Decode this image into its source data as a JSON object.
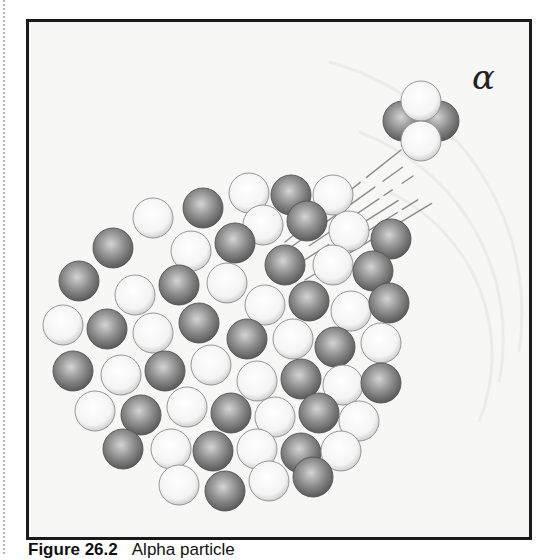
{
  "figure": {
    "symbol": "α",
    "caption_number": "Figure 26.2",
    "caption_text": "Alpha particle",
    "colors": {
      "frame": "#1a1a1a",
      "background": "#f7f7f6",
      "proton_dark": "#6e6e6e",
      "proton_light": "#d4d4d4",
      "neutron_dark": "#c9c9c9",
      "neutron_light": "#ffffff",
      "trail": "#8a8a8a"
    },
    "nucleus": {
      "radius": 20,
      "particles": [
        [
          246,
          190,
          "n"
        ],
        [
          288,
          192,
          "p"
        ],
        [
          330,
          192,
          "n"
        ],
        [
          200,
          205,
          "p"
        ],
        [
          260,
          222,
          "n"
        ],
        [
          304,
          218,
          "p"
        ],
        [
          346,
          228,
          "n"
        ],
        [
          388,
          236,
          "p"
        ],
        [
          150,
          215,
          "n"
        ],
        [
          110,
          245,
          "p"
        ],
        [
          188,
          248,
          "n"
        ],
        [
          232,
          240,
          "p"
        ],
        [
          282,
          262,
          "p"
        ],
        [
          330,
          262,
          "n"
        ],
        [
          370,
          268,
          "p"
        ],
        [
          76,
          278,
          "p"
        ],
        [
          132,
          292,
          "n"
        ],
        [
          176,
          282,
          "p"
        ],
        [
          224,
          280,
          "n"
        ],
        [
          262,
          302,
          "n"
        ],
        [
          306,
          298,
          "p"
        ],
        [
          348,
          308,
          "n"
        ],
        [
          386,
          300,
          "p"
        ],
        [
          60,
          322,
          "n"
        ],
        [
          104,
          326,
          "p"
        ],
        [
          150,
          330,
          "n"
        ],
        [
          196,
          320,
          "p"
        ],
        [
          244,
          336,
          "p"
        ],
        [
          290,
          336,
          "n"
        ],
        [
          332,
          344,
          "p"
        ],
        [
          378,
          340,
          "n"
        ],
        [
          70,
          368,
          "p"
        ],
        [
          118,
          372,
          "n"
        ],
        [
          162,
          368,
          "p"
        ],
        [
          208,
          362,
          "n"
        ],
        [
          254,
          378,
          "n"
        ],
        [
          298,
          376,
          "p"
        ],
        [
          340,
          382,
          "n"
        ],
        [
          378,
          380,
          "p"
        ],
        [
          92,
          408,
          "n"
        ],
        [
          138,
          412,
          "p"
        ],
        [
          184,
          404,
          "n"
        ],
        [
          228,
          410,
          "p"
        ],
        [
          272,
          414,
          "n"
        ],
        [
          316,
          410,
          "p"
        ],
        [
          356,
          418,
          "n"
        ],
        [
          120,
          446,
          "p"
        ],
        [
          168,
          446,
          "n"
        ],
        [
          210,
          448,
          "p"
        ],
        [
          254,
          446,
          "n"
        ],
        [
          298,
          450,
          "p"
        ],
        [
          338,
          448,
          "n"
        ],
        [
          176,
          482,
          "n"
        ],
        [
          222,
          488,
          "p"
        ],
        [
          266,
          478,
          "n"
        ],
        [
          310,
          474,
          "p"
        ]
      ]
    },
    "alpha_particle": {
      "radius": 20,
      "particles": [
        [
          400,
          118,
          "p"
        ],
        [
          436,
          118,
          "p"
        ],
        [
          418,
          98,
          "n"
        ],
        [
          418,
          138,
          "n"
        ]
      ]
    }
  }
}
